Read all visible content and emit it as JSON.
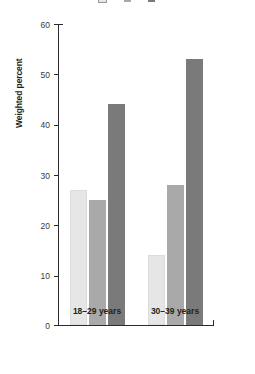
{
  "chart_data": {
    "type": "bar",
    "title": "",
    "xlabel": "",
    "ylabel": "Weighted percent",
    "ylim": [
      0,
      60
    ],
    "yticks": [
      0,
      10,
      20,
      30,
      40,
      50,
      60
    ],
    "grid": false,
    "legend_position": "top",
    "categories": [
      "18–29 years",
      "30–39 years"
    ],
    "series": [
      {
        "name": "Series 1",
        "color": "#e6e6e6",
        "values": [
          27,
          25
        ]
      },
      {
        "name": "Series 2",
        "color": "#a9a9a9",
        "values": [
          25,
          28
        ]
      },
      {
        "name": "Series 3",
        "color": "#7a7a7a",
        "values": [
          44,
          53
        ]
      }
    ],
    "series_corrected": [
      {
        "name": "Series 1",
        "color": "#e6e6e6",
        "values": [
          27,
          14
        ]
      },
      {
        "name": "Series 2",
        "color": "#a9a9a9",
        "values": [
          25,
          28
        ]
      },
      {
        "name": "Series 3",
        "color": "#7a7a7a",
        "values": [
          44,
          53
        ]
      }
    ]
  },
  "axis": {
    "y_title": "Weighted percent",
    "tick_0": "0",
    "tick_10": "10",
    "tick_20": "20",
    "tick_30": "30",
    "tick_40": "40",
    "tick_50": "50",
    "tick_60": "60"
  },
  "categories": {
    "group_1": "18–29 years",
    "group_2": "30–39 years"
  },
  "legend": {
    "item_1": "",
    "item_2": "",
    "item_3": ""
  }
}
